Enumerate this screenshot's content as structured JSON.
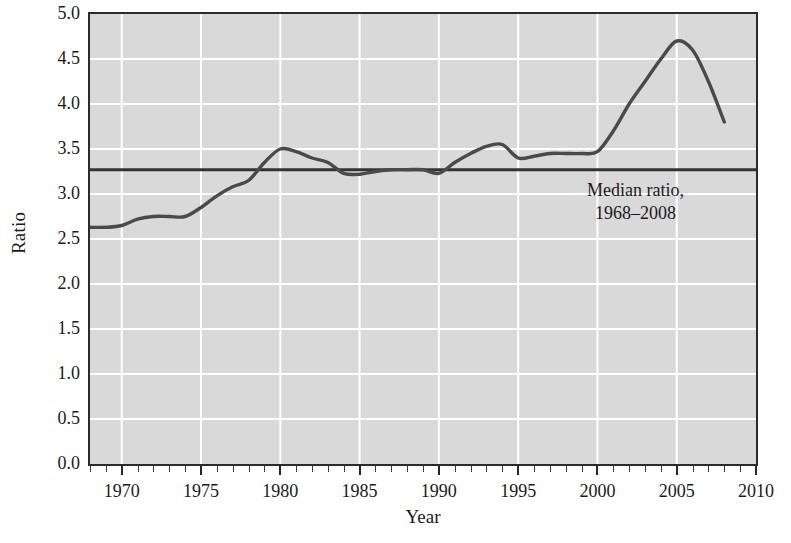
{
  "chart_data": {
    "type": "line",
    "title": "",
    "xlabel": "Year",
    "ylabel": "Ratio",
    "xlim": [
      1968,
      2010
    ],
    "ylim": [
      0.0,
      5.0
    ],
    "grid": true,
    "legend_position": "none",
    "y_ticks": [
      "0.0",
      "0.5",
      "1.0",
      "1.5",
      "2.0",
      "2.5",
      "3.0",
      "3.5",
      "4.0",
      "4.5",
      "5.0"
    ],
    "y_tick_values": [
      0.0,
      0.5,
      1.0,
      1.5,
      2.0,
      2.5,
      3.0,
      3.5,
      4.0,
      4.5,
      5.0
    ],
    "x_ticks": [
      "1970",
      "1975",
      "1980",
      "1985",
      "1990",
      "1995",
      "2000",
      "2005",
      "2010"
    ],
    "x_tick_values": [
      1970,
      1975,
      1980,
      1985,
      1990,
      1995,
      2000,
      2005,
      2010
    ],
    "x_minor_step": 1,
    "series": [
      {
        "name": "Ratio",
        "x": [
          1968,
          1969,
          1970,
          1971,
          1972,
          1973,
          1974,
          1975,
          1976,
          1977,
          1978,
          1979,
          1980,
          1981,
          1982,
          1983,
          1984,
          1985,
          1986,
          1987,
          1988,
          1989,
          1990,
          1991,
          1992,
          1993,
          1994,
          1995,
          1996,
          1997,
          1998,
          1999,
          2000,
          2001,
          2002,
          2003,
          2004,
          2005,
          2006,
          2007,
          2008
        ],
        "values": [
          2.63,
          2.63,
          2.65,
          2.72,
          2.75,
          2.75,
          2.75,
          2.85,
          2.98,
          3.08,
          3.15,
          3.35,
          3.5,
          3.47,
          3.4,
          3.35,
          3.23,
          3.22,
          3.25,
          3.27,
          3.27,
          3.27,
          3.23,
          3.35,
          3.45,
          3.53,
          3.55,
          3.4,
          3.42,
          3.45,
          3.45,
          3.45,
          3.47,
          3.7,
          4.0,
          4.25,
          4.5,
          4.7,
          4.6,
          4.25,
          3.8
        ]
      },
      {
        "name": "Median ratio, 1968–2008",
        "type": "hline",
        "value": 3.27
      }
    ],
    "annotations": [
      {
        "name": "median-ratio-label",
        "line1": "Median ratio,",
        "line2": "1968–2008",
        "x": 2002.4,
        "y": 2.95
      }
    ],
    "colors": {
      "panel_background": "#d9d9d9",
      "gridline": "#ffffff",
      "data_line": "#4a4a4a",
      "median_line": "#333333",
      "axis": "#2b2b2b",
      "text": "#1a1a1a"
    }
  }
}
